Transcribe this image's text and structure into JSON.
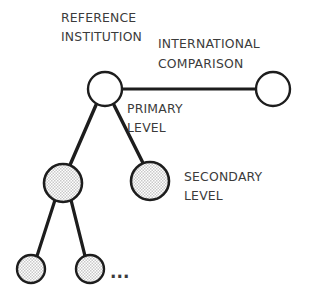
{
  "diagram": {
    "kind": "tree",
    "background_color": "#ffffff",
    "edge_color": "#1d1d1d",
    "node_outline_color": "#1d1d1d",
    "node_white_fill": "#ffffff",
    "node_shaded_fill": "#d8d8d8",
    "label_color": "#3b3b3b",
    "labels": {
      "reference_institution_line1": "REFERENCE",
      "reference_institution_line2": "INSTITUTION",
      "international_comparison_line1": "INTERNATIONAL",
      "international_comparison_line2": "COMPARISON",
      "primary_level_line1": "PRIMARY",
      "primary_level_line2": "LEVEL",
      "secondary_level_line1": "SECONDARY",
      "secondary_level_line2": "LEVEL",
      "continuation": "..."
    },
    "nodes": [
      {
        "id": "reference-institution",
        "label": "REFERENCE INSTITUTION",
        "cx": 105,
        "cy": 89,
        "r": 17,
        "fill": "white",
        "level": "primary"
      },
      {
        "id": "international-comparison",
        "label": "INTERNATIONAL COMPARISON",
        "cx": 273,
        "cy": 89,
        "r": 17,
        "fill": "white",
        "level": "primary"
      },
      {
        "id": "secondary-left",
        "label": "",
        "cx": 63,
        "cy": 183,
        "r": 19,
        "fill": "shaded",
        "level": "secondary"
      },
      {
        "id": "secondary-right",
        "label": "SECONDARY LEVEL",
        "cx": 150,
        "cy": 181,
        "r": 19,
        "fill": "shaded",
        "level": "secondary"
      },
      {
        "id": "tertiary-left",
        "label": "",
        "cx": 31,
        "cy": 269,
        "r": 14,
        "fill": "shaded",
        "level": "tertiary"
      },
      {
        "id": "tertiary-right",
        "label": "",
        "cx": 90,
        "cy": 269,
        "r": 14,
        "fill": "shaded",
        "level": "tertiary"
      }
    ],
    "edges": [
      {
        "id": "edge-root-international",
        "from": "reference-institution",
        "to": "international-comparison",
        "x1": 122,
        "y1": 89,
        "x2": 256,
        "y2": 89
      },
      {
        "id": "edge-root-secondary-left",
        "from": "reference-institution",
        "to": "secondary-left",
        "x1": 96,
        "y1": 105,
        "x2": 70,
        "y2": 165
      },
      {
        "id": "edge-root-secondary-right",
        "from": "reference-institution",
        "to": "secondary-right",
        "x1": 114,
        "y1": 105,
        "x2": 143,
        "y2": 163
      },
      {
        "id": "edge-secondary-tertiary-left",
        "from": "secondary-left",
        "to": "tertiary-left",
        "x1": 55,
        "y1": 200,
        "x2": 37,
        "y2": 256
      },
      {
        "id": "edge-secondary-tertiary-right",
        "from": "secondary-left",
        "to": "tertiary-right",
        "x1": 71,
        "y1": 200,
        "x2": 85,
        "y2": 256
      }
    ],
    "text_blocks": [
      {
        "id": "reference-institution-label",
        "x": 61,
        "y": 22,
        "lines": [
          "REFERENCE",
          "INSTITUTION"
        ]
      },
      {
        "id": "international-comparison-label",
        "x": 158,
        "y": 48,
        "lines": [
          "INTERNATIONAL",
          "COMPARISON"
        ]
      },
      {
        "id": "primary-level-label",
        "x": 127,
        "y": 113,
        "lines": [
          "PRIMARY",
          "LEVEL"
        ]
      },
      {
        "id": "secondary-level-label",
        "x": 184,
        "y": 181,
        "lines": [
          "SECONDARY",
          "LEVEL"
        ]
      }
    ]
  }
}
